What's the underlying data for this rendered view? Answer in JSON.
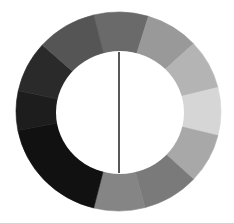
{
  "canvas": {
    "width": 234,
    "height": 223,
    "background": "#ffffff"
  },
  "ring": {
    "center": {
      "x": 118.5,
      "y": 111.5
    },
    "outer_radius": {
      "rx": 102.5,
      "ry": 99.5
    },
    "inner_radius": {
      "rx": 64,
      "ry": 61.5
    },
    "inner_center": {
      "x": 120,
      "y": 112.5
    },
    "segments": [
      {
        "start_deg": -14,
        "end_deg": 17,
        "color": "#6a6a6a"
      },
      {
        "start_deg": 17,
        "end_deg": 47,
        "color": "#999999"
      },
      {
        "start_deg": 47,
        "end_deg": 76,
        "color": "#b4b4b4"
      },
      {
        "start_deg": 76,
        "end_deg": 104,
        "color": "#d6d6d6"
      },
      {
        "start_deg": 104,
        "end_deg": 133,
        "color": "#a8a8a8"
      },
      {
        "start_deg": 133,
        "end_deg": 165,
        "color": "#7a7a7a"
      },
      {
        "start_deg": 165,
        "end_deg": 194,
        "color": "#858585"
      },
      {
        "start_deg": 194,
        "end_deg": 259,
        "color": "#111111"
      },
      {
        "start_deg": 259,
        "end_deg": 282,
        "color": "#1d1d1d"
      },
      {
        "start_deg": 282,
        "end_deg": 312,
        "color": "#2a2a2a"
      },
      {
        "start_deg": 312,
        "end_deg": 346,
        "color": "#555555"
      }
    ]
  },
  "center_line": {
    "x": 119,
    "y1": 52,
    "y2": 173,
    "color": "#111111",
    "width": 1.4
  }
}
